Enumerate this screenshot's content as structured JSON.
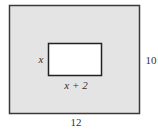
{
  "diagram": {
    "type": "geometry-figure",
    "outer_rect": {
      "width_label": "12",
      "height_label": "10",
      "fill": "#e4e4e4",
      "stroke": "#3a3a3a"
    },
    "inner_rect": {
      "width_label": "x + 2",
      "height_label": "x",
      "fill": "#ffffff",
      "stroke": "#222222"
    }
  }
}
